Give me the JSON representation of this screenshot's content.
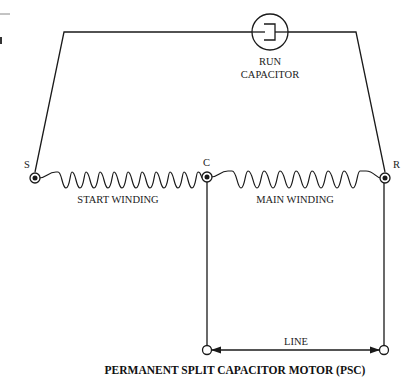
{
  "diagram": {
    "title": "PERMANENT SPLIT CAPACITOR MOTOR (PSC)",
    "capacitor": {
      "label_line1": "RUN",
      "label_line2": "CAPACITOR",
      "icon": "capacitor-icon"
    },
    "terminals": {
      "start": "S",
      "common": "C",
      "run": "R"
    },
    "windings": {
      "start": {
        "label": "START WINDING",
        "turns": 11
      },
      "main": {
        "label": "MAIN WINDING",
        "turns": 9
      }
    },
    "line": {
      "label": "LINE"
    },
    "colors": {
      "stroke": "#1a1a1a",
      "background": "#ffffff"
    }
  }
}
